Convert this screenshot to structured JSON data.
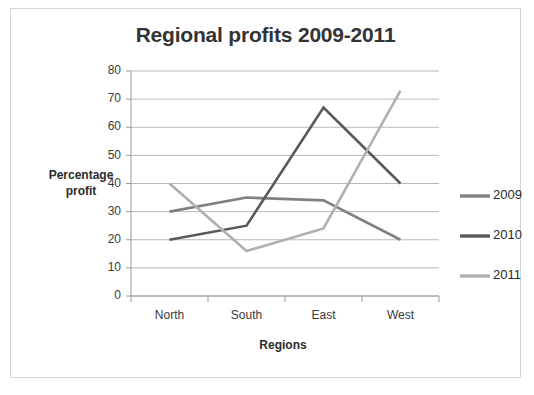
{
  "chart_data": {
    "type": "line",
    "title": "Regional profits 2009-2011",
    "xlabel": "Regions",
    "ylabel": "Percentage profit",
    "ylabel_line1": "Percentage",
    "ylabel_line2": "profit",
    "categories": [
      "North",
      "South",
      "East",
      "West"
    ],
    "ylim": [
      0,
      80
    ],
    "yticks": [
      0,
      10,
      20,
      30,
      40,
      50,
      60,
      70,
      80
    ],
    "ytick_labels": [
      "0",
      "10",
      "20",
      "30",
      "40",
      "50",
      "60",
      "70",
      "80"
    ],
    "grid": true,
    "legend_position": "right",
    "series": [
      {
        "name": "2009",
        "values": [
          30,
          35,
          34,
          20
        ],
        "color": "#808080"
      },
      {
        "name": "2010",
        "values": [
          20,
          25,
          67,
          40
        ],
        "color": "#595959"
      },
      {
        "name": "2011",
        "values": [
          40,
          16,
          24,
          73
        ],
        "color": "#b0b0b0"
      }
    ]
  },
  "frame": {
    "border_color": "#d5d5d5",
    "background": "#ffffff"
  }
}
